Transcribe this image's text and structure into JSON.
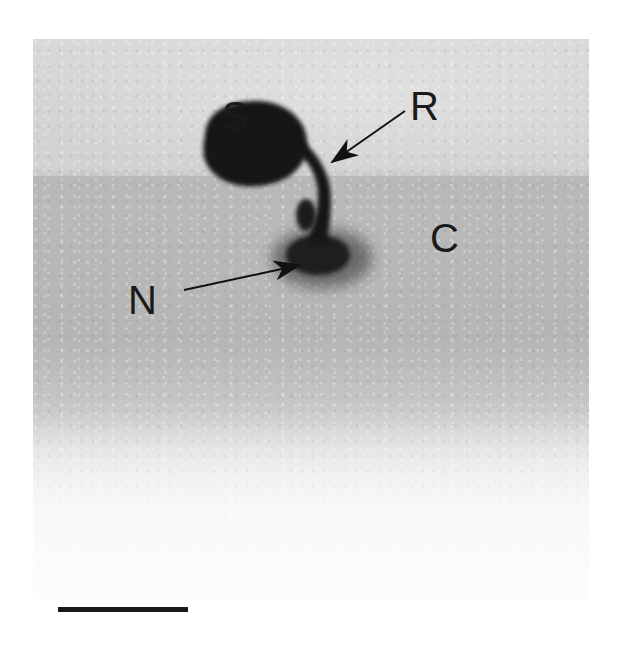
{
  "figure": {
    "labels": {
      "S": "S",
      "R": "R",
      "C": "C",
      "N": "N"
    },
    "scale_bar": {
      "present": true
    },
    "colors": {
      "label_ink": "#1a1a1a",
      "specimen_dark": "#121212",
      "background_light": "#d9d9d9",
      "cuticle_band": "#b8b8b8",
      "paper": "#ffffff"
    }
  }
}
